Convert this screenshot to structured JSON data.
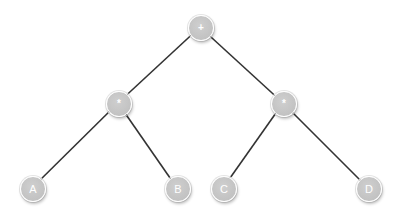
{
  "diagram": {
    "type": "expression-tree",
    "colors": {
      "edge": "#333333",
      "node_fill": "#c6c6c6",
      "node_border": "#ffffff",
      "label": "#ffffff",
      "background": "#ffffff"
    },
    "nodes": [
      {
        "id": "root",
        "label": "+",
        "x": 200,
        "y": 27
      },
      {
        "id": "mul_left",
        "label": "*",
        "x": 118,
        "y": 103
      },
      {
        "id": "mul_right",
        "label": "*",
        "x": 283,
        "y": 103
      },
      {
        "id": "leaf_a",
        "label": "A",
        "x": 32,
        "y": 188
      },
      {
        "id": "leaf_b",
        "label": "B",
        "x": 177,
        "y": 188
      },
      {
        "id": "leaf_c",
        "label": "C",
        "x": 223,
        "y": 188
      },
      {
        "id": "leaf_d",
        "label": "D",
        "x": 368,
        "y": 188
      }
    ],
    "edges": [
      {
        "from": "root",
        "to": "mul_left"
      },
      {
        "from": "root",
        "to": "mul_right"
      },
      {
        "from": "mul_left",
        "to": "leaf_a"
      },
      {
        "from": "mul_left",
        "to": "leaf_b"
      },
      {
        "from": "mul_right",
        "to": "leaf_c"
      },
      {
        "from": "mul_right",
        "to": "leaf_d"
      }
    ]
  }
}
